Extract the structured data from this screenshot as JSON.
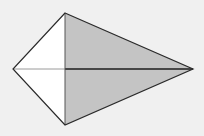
{
  "diagram": {
    "type": "kite",
    "background": "#f0f0f0",
    "vertices": {
      "top": [
        65,
        13
      ],
      "left": [
        13,
        69
      ],
      "right": [
        193,
        69
      ],
      "bottom": [
        65,
        125
      ],
      "center": [
        65,
        69
      ]
    },
    "regions": {
      "left_triangles": {
        "fill": "#ffffff"
      },
      "right_triangles": {
        "fill": "#c4c4c4"
      }
    },
    "colors": {
      "outline": "#2a2a2a",
      "vertical_diagonal": "#555555",
      "left_diagonal": "#9a9a9a",
      "right_diagonal": "#1e1e1e"
    }
  }
}
